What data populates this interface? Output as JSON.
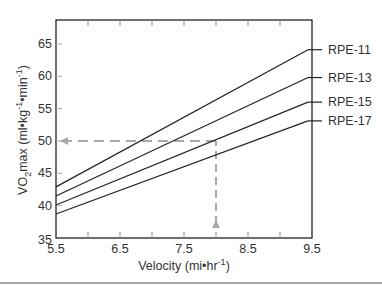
{
  "chart_data": {
    "type": "line",
    "title": "",
    "xlabel": "Velocity (mi•hr⁻¹)",
    "ylabel": "VO₂max (ml•kg⁻¹•min⁻¹)",
    "xlim": [
      5.5,
      9.5
    ],
    "ylim": [
      35,
      68
    ],
    "x_ticks": [
      5.5,
      6.5,
      7.5,
      8.5,
      9.5
    ],
    "y_ticks": [
      35,
      40,
      45,
      50,
      55,
      60,
      65
    ],
    "grid": false,
    "legend_position": "right (direct labels)",
    "x": [
      5.5,
      9.5
    ],
    "series": [
      {
        "name": "RPE-11",
        "values": [
          42.9,
          64.1
        ]
      },
      {
        "name": "RPE-13",
        "values": [
          41.5,
          59.8
        ]
      },
      {
        "name": "RPE-15",
        "values": [
          40.1,
          56.0
        ]
      },
      {
        "name": "RPE-17",
        "values": [
          38.7,
          53.1
        ]
      }
    ],
    "annotations": [
      {
        "type": "dashed-arrow",
        "description": "vertical dashed line from x-axis up at velocity 8.0",
        "x": 8.0
      },
      {
        "type": "dashed-arrow",
        "description": "horizontal dashed line at VO2max 50 pointing to y-axis",
        "y": 50
      }
    ]
  },
  "labels": {
    "xlabel_main": "Velocity (mi•hr",
    "xlabel_sup": "-1",
    "xlabel_end": ")",
    "ylabel_vo": "VO",
    "ylabel_sub": "2",
    "ylabel_mid1": "max (ml•kg",
    "ylabel_sup1": "-1",
    "ylabel_mid2": "•min",
    "ylabel_sup2": "-1",
    "ylabel_end": ")"
  },
  "colors": {
    "line": "#222222",
    "axis": "#222222",
    "dashed": "#a8a8a8",
    "divider": "#8a8a8a"
  }
}
